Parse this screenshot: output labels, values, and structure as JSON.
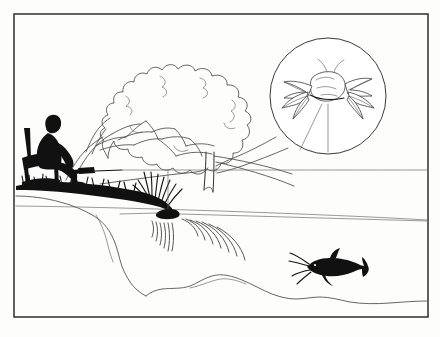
{
  "illustration": {
    "title": "Angler fishing from shore with magnified bait inset",
    "style": "black-and-white line drawing",
    "background_color": "#fdfdfb",
    "ink_color": "#111111",
    "line_color": "#3a3a3a",
    "frame": {
      "name": "picture-border",
      "x": 14,
      "y": 14,
      "width": 414,
      "height": 303,
      "stroke_color": "#2e2e2e"
    }
  },
  "elements": {
    "tree": {
      "label": "large leafy tree",
      "canopy_label": "tree-canopy",
      "trunk_label": "tree-trunk",
      "branches_label": "tree-branches"
    },
    "angler": {
      "label": "seated angler silhouette",
      "chair_label": "folding chair",
      "rod_label": "fishing rod"
    },
    "bank": {
      "label": "grassy shoreline bank",
      "grass_label": "grass tufts"
    },
    "water": {
      "label": "lake water surface",
      "horizon_label": "far shoreline horizon",
      "near_shore_label": "near water edge",
      "ripples_label": "concentric ripples at bait impact"
    },
    "bait": {
      "label": "bait hitting the water",
      "line_label": "fishing line"
    },
    "catfish": {
      "label": "catfish silhouette with barbels"
    },
    "magnifier": {
      "label": "magnified inset circle",
      "center_x": 328,
      "center_y": 96,
      "radius": 58,
      "subject_label": "magnified bait insect on hook",
      "leader_label": "magnifier leader lines"
    }
  },
  "caption": ""
}
